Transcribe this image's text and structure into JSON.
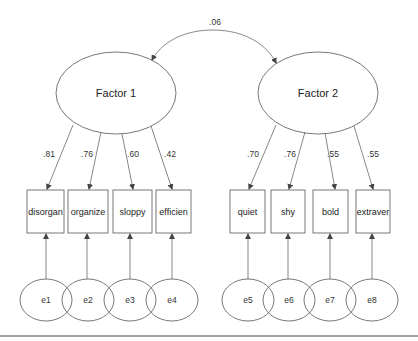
{
  "diagram": {
    "type": "confirmatory factor analysis path diagram",
    "correlation": {
      "label": ".06",
      "between": [
        "Factor 1",
        "Factor 2"
      ]
    },
    "factors": [
      {
        "label": "Factor 1",
        "indicators": [
          {
            "label": "disorgan",
            "loading": ".81",
            "error": "e1"
          },
          {
            "label": "organize",
            "loading": ".76",
            "error": "e2"
          },
          {
            "label": "sloppy",
            "loading": ".60",
            "error": "e3"
          },
          {
            "label": "efficien",
            "loading": ".42",
            "error": "e4"
          }
        ]
      },
      {
        "label": "Factor 2",
        "indicators": [
          {
            "label": "quiet",
            "loading": ".70",
            "error": "e5"
          },
          {
            "label": "shy",
            "loading": ".76",
            "error": "e6"
          },
          {
            "label": "bold",
            "loading": ".55",
            "error": "e7"
          },
          {
            "label": "extraver",
            "loading": ".55",
            "error": "e8"
          }
        ]
      }
    ],
    "colors": {
      "stroke": "#555555",
      "text": "#222222",
      "background": "#ffffff"
    }
  }
}
